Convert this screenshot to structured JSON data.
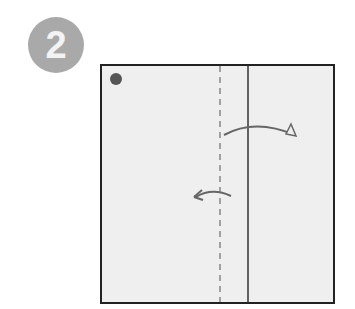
{
  "step": {
    "number": "2"
  },
  "diagram": {
    "paper_fill": "#efefef",
    "border_color": "#222222",
    "dot_color": "#555555",
    "arrow_color": "#666666",
    "valley_fold_line": "dashed",
    "crease_line": "solid",
    "arrows": [
      {
        "name": "fold-right-arrow",
        "direction": "right"
      },
      {
        "name": "fold-left-arrow",
        "direction": "left"
      }
    ]
  }
}
